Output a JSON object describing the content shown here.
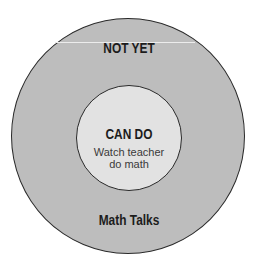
{
  "diagram": {
    "outer_ring": {
      "label": "NOT YET",
      "bottom_label": "Math Talks",
      "fill": "#bdbdbd"
    },
    "inner_circle": {
      "label": "CAN DO",
      "desc_line1": "Watch teacher",
      "desc_line2": "do math",
      "fill": "#e2e2e2"
    },
    "stroke": "#2a2a2a"
  }
}
